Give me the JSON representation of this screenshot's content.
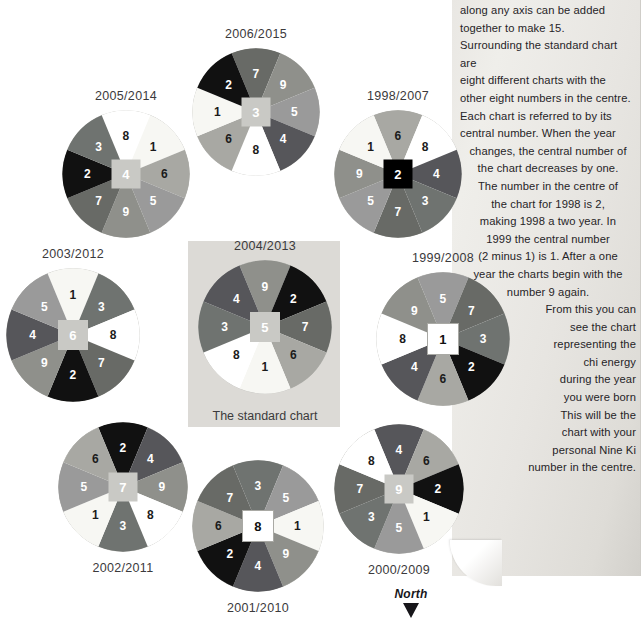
{
  "palette": {
    "1": "#f7f7f3",
    "2": "#111111",
    "3": "#6f7370",
    "4": "#56565a",
    "5": "#9a9a9a",
    "6": "#a8a8a3",
    "7": "#686a66",
    "8": "#ffffff",
    "9": "#8f908b"
  },
  "label_color": {
    "1": "dark-text",
    "2": "light-text",
    "3": "light-text",
    "4": "light-text",
    "5": "light-text",
    "6": "dark-text",
    "7": "light-text",
    "8": "dark-text",
    "9": "light-text"
  },
  "text_panel": {
    "lines": [
      {
        "text": "along any axis can be added",
        "align": "left"
      },
      {
        "text": "together to make 15.",
        "align": "left"
      },
      {
        "text": "Surrounding the standard chart are",
        "align": "left"
      },
      {
        "text": "eight different charts with the",
        "align": "left"
      },
      {
        "text": "other eight numbers in the centre.",
        "align": "left"
      },
      {
        "text": "Each chart is referred to by its",
        "align": "left"
      },
      {
        "text": "central number. When the year",
        "align": "left"
      },
      {
        "text": "changes, the central number of",
        "align": "center"
      },
      {
        "text": "the chart decreases by one.",
        "align": "center"
      },
      {
        "text": "The number in the centre of",
        "align": "center"
      },
      {
        "text": "the chart for 1998 is 2,",
        "align": "center"
      },
      {
        "text": "making 1998 a two year. In",
        "align": "center"
      },
      {
        "text": "1999 the central number",
        "align": "center"
      },
      {
        "text": "(2 minus 1) is 1. After a one",
        "align": "center"
      },
      {
        "text": "year the charts begin with the",
        "align": "center"
      },
      {
        "text": "number 9 again.",
        "align": "center"
      },
      {
        "text": "From this you can",
        "align": "right"
      },
      {
        "text": "see the chart",
        "align": "right"
      },
      {
        "text": "representing the",
        "align": "right"
      },
      {
        "text": "chi energy",
        "align": "right"
      },
      {
        "text": "during the year",
        "align": "right"
      },
      {
        "text": "you were born",
        "align": "right"
      },
      {
        "text": "This will be the",
        "align": "right"
      },
      {
        "text": "chart with your",
        "align": "right"
      },
      {
        "text": "personal Nine Ki",
        "align": "right"
      },
      {
        "text": "number in the centre.",
        "align": "right"
      }
    ]
  },
  "north_marker": {
    "label": "North"
  },
  "standard_chart_caption": "The standard chart",
  "chart_data": {
    "type": "pie",
    "note": "Each wheel is a nine-sector pie (8 outer sectors + a centre square). Sector order is listed clockwise starting at the 12 o'clock sector.",
    "charts": [
      {
        "id": "chart-2005-2014",
        "title": "2005/2014",
        "title_position": "above",
        "center": "4",
        "center_style": "grey",
        "sectors_clockwise": [
          "8",
          "1",
          "6",
          "5",
          "9",
          "7",
          "2",
          "3"
        ],
        "values": [
          1,
          1,
          1,
          1,
          1,
          1,
          1,
          1
        ]
      },
      {
        "id": "chart-2006-2015",
        "title": "2006/2015",
        "title_position": "above",
        "center": "3",
        "center_style": "grey",
        "sectors_clockwise": [
          "7",
          "9",
          "5",
          "4",
          "8",
          "6",
          "1",
          "2"
        ],
        "values": [
          1,
          1,
          1,
          1,
          1,
          1,
          1,
          1
        ]
      },
      {
        "id": "chart-1998-2007",
        "title": "1998/2007",
        "title_position": "above",
        "center": "2",
        "center_style": "black",
        "sectors_clockwise": [
          "6",
          "8",
          "4",
          "3",
          "7",
          "5",
          "9",
          "1"
        ],
        "values": [
          1,
          1,
          1,
          1,
          1,
          1,
          1,
          1
        ]
      },
      {
        "id": "chart-2003-2012",
        "title": "2003/2012",
        "title_position": "above",
        "center": "6",
        "center_style": "grey",
        "sectors_clockwise": [
          "1",
          "3",
          "8",
          "7",
          "2",
          "9",
          "4",
          "5"
        ],
        "values": [
          1,
          1,
          1,
          1,
          1,
          1,
          1,
          1
        ]
      },
      {
        "id": "chart-2004-2013",
        "title": "2004/2013",
        "title_position": "above",
        "center": "5",
        "center_style": "grey",
        "sectors_clockwise": [
          "9",
          "2",
          "7",
          "6",
          "1",
          "8",
          "3",
          "4"
        ],
        "values": [
          1,
          1,
          1,
          1,
          1,
          1,
          1,
          1
        ]
      },
      {
        "id": "chart-1999-2008",
        "title": "1999/2008",
        "title_position": "above",
        "center": "1",
        "center_style": "white",
        "sectors_clockwise": [
          "5",
          "7",
          "3",
          "2",
          "6",
          "4",
          "8",
          "9"
        ],
        "values": [
          1,
          1,
          1,
          1,
          1,
          1,
          1,
          1
        ]
      },
      {
        "id": "chart-2002-2011",
        "title": "2002/2011",
        "title_position": "below",
        "center": "7",
        "center_style": "grey",
        "sectors_clockwise": [
          "2",
          "4",
          "9",
          "8",
          "3",
          "1",
          "5",
          "6"
        ],
        "values": [
          1,
          1,
          1,
          1,
          1,
          1,
          1,
          1
        ]
      },
      {
        "id": "chart-2001-2010",
        "title": "2001/2010",
        "title_position": "below",
        "center": "8",
        "center_style": "white",
        "sectors_clockwise": [
          "3",
          "5",
          "1",
          "9",
          "4",
          "2",
          "6",
          "7"
        ],
        "values": [
          1,
          1,
          1,
          1,
          1,
          1,
          1,
          1
        ]
      },
      {
        "id": "chart-2000-2009",
        "title": "2000/2009",
        "title_position": "below",
        "center": "9",
        "center_style": "grey",
        "sectors_clockwise": [
          "4",
          "6",
          "2",
          "1",
          "5",
          "3",
          "7",
          "8"
        ],
        "values": [
          1,
          1,
          1,
          1,
          1,
          1,
          1,
          1
        ]
      }
    ]
  },
  "layout": {
    "positions": {
      "chart-2005-2014": {
        "left": 62,
        "top": 110,
        "size": 128
      },
      "chart-2006-2015": {
        "left": 192,
        "top": 48,
        "size": 128
      },
      "chart-1998-2007": {
        "left": 334,
        "top": 110,
        "size": 128
      },
      "chart-2003-2012": {
        "left": 6,
        "top": 268,
        "size": 134
      },
      "chart-2004-2013": {
        "left": 198,
        "top": 260,
        "size": 134
      },
      "chart-1999-2008": {
        "left": 376,
        "top": 272,
        "size": 134
      },
      "chart-2002-2011": {
        "left": 58,
        "top": 422,
        "size": 130
      },
      "chart-2001-2010": {
        "left": 192,
        "top": 460,
        "size": 132
      },
      "chart-2000-2009": {
        "left": 334,
        "top": 424,
        "size": 130
      }
    }
  }
}
